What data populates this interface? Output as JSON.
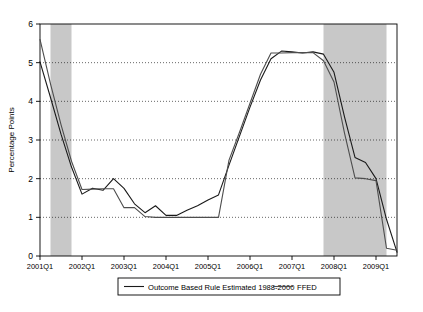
{
  "chart_data": {
    "type": "line",
    "title": "",
    "xlabel": "",
    "ylabel": "Percentage Points",
    "ylim": [
      0,
      6
    ],
    "yticks": [
      0,
      1,
      2,
      3,
      4,
      5,
      6
    ],
    "ytick_labels": [
      "0",
      "1",
      "2",
      "3",
      "4",
      "5",
      "6"
    ],
    "grid": true,
    "grid_style": "dotted-horizontal",
    "xlim": [
      "2001Q1",
      "2009Q3"
    ],
    "xticks": [
      "2001Q1",
      "2002Q1",
      "2003Q1",
      "2004Q1",
      "2005Q1",
      "2006Q1",
      "2007Q1",
      "2008Q1",
      "2009Q1"
    ],
    "x": [
      "2001Q1",
      "2001Q2",
      "2001Q3",
      "2001Q4",
      "2002Q1",
      "2002Q2",
      "2002Q3",
      "2002Q4",
      "2003Q1",
      "2003Q2",
      "2003Q3",
      "2003Q4",
      "2004Q1",
      "2004Q2",
      "2004Q3",
      "2004Q4",
      "2005Q1",
      "2005Q2",
      "2005Q3",
      "2005Q4",
      "2006Q1",
      "2006Q2",
      "2006Q3",
      "2006Q4",
      "2007Q1",
      "2007Q2",
      "2007Q3",
      "2007Q4",
      "2008Q1",
      "2008Q2",
      "2008Q3",
      "2008Q4",
      "2009Q1",
      "2009Q2",
      "2009Q3"
    ],
    "legend_position": "below-axes",
    "series": [
      {
        "name": "Outcome Based Rule Estimated 1988-2000",
        "color": "#1a1a1a",
        "linewidth": 1.1,
        "values": [
          5.02,
          4.1,
          3.15,
          2.3,
          1.6,
          1.75,
          1.7,
          2.0,
          1.75,
          1.35,
          1.12,
          1.3,
          1.05,
          1.05,
          1.18,
          1.3,
          1.45,
          1.58,
          2.35,
          3.1,
          3.85,
          4.55,
          5.1,
          5.3,
          5.28,
          5.25,
          5.28,
          5.22,
          4.75,
          3.6,
          2.55,
          2.42,
          2.0,
          0.95,
          0.1
        ]
      },
      {
        "name": "FFED",
        "color": "#4d4d4d",
        "linewidth": 1.1,
        "values": [
          5.6,
          4.45,
          3.4,
          2.45,
          1.72,
          1.73,
          1.74,
          1.74,
          1.25,
          1.25,
          1.02,
          1.0,
          1.0,
          1.0,
          1.0,
          1.0,
          1.0,
          1.0,
          2.48,
          3.2,
          3.95,
          4.7,
          5.25,
          5.25,
          5.26,
          5.26,
          5.26,
          5.05,
          4.5,
          3.18,
          2.02,
          2.0,
          1.95,
          0.2,
          0.15
        ]
      }
    ],
    "shaded_regions": [
      {
        "name": "recession-band-2001",
        "start": "2001Q2",
        "end": "2001Q4",
        "color": "#c8c8c8"
      },
      {
        "name": "recession-band-2008",
        "start": "2007Q4",
        "end": "2009Q2",
        "color": "#c8c8c8"
      }
    ],
    "legend_entries": [
      {
        "label": "Outcome Based Rule Estimated 1988-2000",
        "color": "#1a1a1a"
      },
      {
        "label": "FFED",
        "color": "#4d4d4d"
      }
    ]
  },
  "axis": {
    "y_label": "Percentage Points"
  }
}
